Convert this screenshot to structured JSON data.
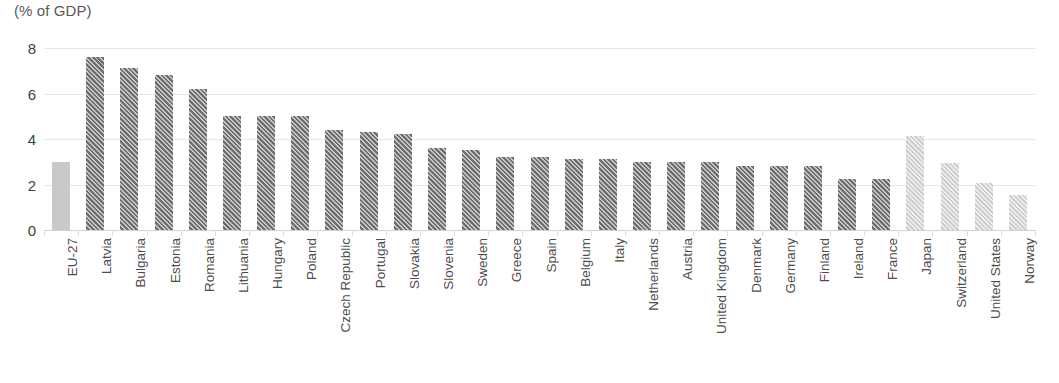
{
  "chart_data": {
    "type": "bar",
    "title": "(% of GDP)",
    "xlabel": "",
    "ylabel": "",
    "ylim": [
      0,
      8
    ],
    "yticks": [
      0,
      2,
      4,
      6,
      8
    ],
    "grid": true,
    "legend": "none",
    "categories": [
      "EU-27",
      "Latvia",
      "Bulgaria",
      "Estonia",
      "Romania",
      "Lithuania",
      "Hungary",
      "Poland",
      "Czech Republic",
      "Portugal",
      "Slovakia",
      "Slovenia",
      "Sweden",
      "Greece",
      "Spain",
      "Belgium",
      "Italy",
      "Netherlands",
      "Austria",
      "United Kingdom",
      "Denmark",
      "Germany",
      "Finland",
      "Ireland",
      "France",
      "Japan",
      "Switzerland",
      "United States",
      "Norway"
    ],
    "values": [
      3.0,
      7.6,
      7.1,
      6.8,
      6.2,
      5.0,
      5.0,
      5.0,
      4.4,
      4.3,
      4.2,
      3.6,
      3.5,
      3.2,
      3.2,
      3.1,
      3.1,
      3.0,
      3.0,
      3.0,
      2.8,
      2.8,
      2.8,
      2.25,
      2.25,
      4.15,
      2.95,
      2.05,
      1.55
    ],
    "bar_styles": [
      "solid",
      "dark",
      "dark",
      "dark",
      "dark",
      "dark",
      "dark",
      "dark",
      "dark",
      "dark",
      "dark",
      "dark",
      "dark",
      "dark",
      "dark",
      "dark",
      "dark",
      "dark",
      "dark",
      "dark",
      "dark",
      "dark",
      "dark",
      "dark",
      "dark",
      "light",
      "light",
      "light",
      "light"
    ],
    "colors": {
      "dark_bar": "#6e6e6e",
      "light_bar": "#cfcfcf",
      "reference_bar": "#c9c9c9",
      "gridline": "#e6e6e6",
      "axis_text": "#4d4d4d",
      "title_text": "#595959"
    }
  }
}
